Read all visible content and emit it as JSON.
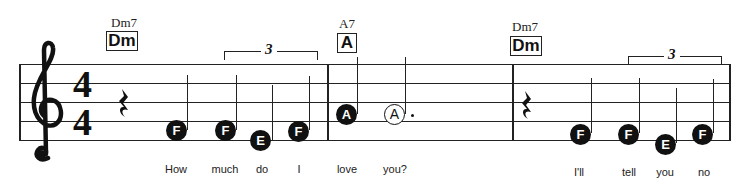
{
  "score": {
    "time_signature": {
      "top": "4",
      "bottom": "4"
    },
    "clef": "treble-clef",
    "chords": [
      {
        "name": "Dm7",
        "box": "Dm"
      },
      {
        "name": "A7",
        "box": "A"
      },
      {
        "name": "Dm7",
        "box": "Dm"
      }
    ],
    "triplet_label": "3",
    "notes": [
      {
        "letter": "F",
        "filled": true
      },
      {
        "letter": "F",
        "filled": true
      },
      {
        "letter": "E",
        "filled": true
      },
      {
        "letter": "F",
        "filled": true
      },
      {
        "letter": "A",
        "filled": true
      },
      {
        "letter": "A",
        "filled": false,
        "dotted": true
      },
      {
        "letter": "F",
        "filled": true
      },
      {
        "letter": "F",
        "filled": true
      },
      {
        "letter": "E",
        "filled": true
      },
      {
        "letter": "F",
        "filled": true
      }
    ],
    "lyrics": [
      "How",
      "much",
      "do",
      "I",
      "love",
      "you?",
      "I'll",
      "tell",
      "you",
      "no"
    ]
  }
}
